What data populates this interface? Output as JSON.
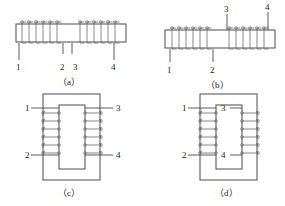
{
  "figure": {
    "background_color": "#ffffff",
    "line_color": "#4a4a4a",
    "coil_color": "#6a6a6a",
    "panels": [
      {
        "id": "a",
        "caption": "（a）",
        "type": "straight-core-solenoid",
        "description": "Horizontal bar core with two coil groups wound on it, four numbered taps below",
        "terminal_labels": [
          "1",
          "2",
          "3",
          "4"
        ],
        "coil_groups": 2,
        "turns_per_group": 6
      },
      {
        "id": "b",
        "caption": "（b）",
        "type": "straight-core-solenoid",
        "description": "Horizontal bar core with two coil groups, taps 1 and 2 below, taps 3 and 4 above",
        "terminal_labels": [
          "1",
          "2",
          "3",
          "4"
        ],
        "labels_below": [
          "1",
          "2"
        ],
        "labels_above": [
          "3",
          "4"
        ],
        "coil_groups": 2,
        "turns_per_group": 6
      },
      {
        "id": "c",
        "caption": "（c）",
        "type": "rectangular-core-transformer",
        "description": "Rectangular closed core with windings on left and right legs, terminals outside",
        "terminal_labels": [
          "1",
          "2",
          "3",
          "4"
        ],
        "labels_left": [
          "1",
          "2"
        ],
        "labels_right": [
          "3",
          "4"
        ],
        "turns_per_winding": 6
      },
      {
        "id": "d",
        "caption": "（d）",
        "type": "rectangular-core-transformer",
        "description": "Rectangular closed core with windings on left and right legs, terminals 1 and 2 outside left, terminals 3 and 4 inside the core window",
        "terminal_labels": [
          "1",
          "2",
          "3",
          "4"
        ],
        "labels_left": [
          "1",
          "2"
        ],
        "labels_inside": [
          "3",
          "4"
        ],
        "turns_per_winding": 6
      }
    ]
  }
}
